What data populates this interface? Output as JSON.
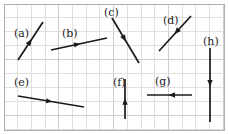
{
  "figure": {
    "width": 228,
    "height": 134,
    "background_color": "#ffffff",
    "grid": {
      "visible": true,
      "line_color": "#d8d8d8",
      "major_line_color": "#c9c9c9",
      "cell_width": 13.7,
      "cell_height": 13.9,
      "origin_x": 4,
      "origin_y": 4,
      "columns": 16,
      "rows": 9
    },
    "frame": {
      "visible": true,
      "color": "#b0b0b0",
      "x": 4,
      "y": 4,
      "width": 220,
      "height": 126
    },
    "vector_color": "#1a1a1a",
    "label_color": "#222222"
  },
  "vectors": [
    {
      "id": "a",
      "label": "(a)",
      "label_x": 14,
      "label_y": 34,
      "x1": 18,
      "y1": 60,
      "x2": 43,
      "y2": 22,
      "direction": "up-right",
      "head_t": 0.55,
      "head_size": 5.0
    },
    {
      "id": "b",
      "label": "(b)",
      "label_x": 62,
      "label_y": 34,
      "x1": 51,
      "y1": 50,
      "x2": 107,
      "y2": 38,
      "direction": "right-slightly-up",
      "head_t": 0.52,
      "head_size": 4.6
    },
    {
      "id": "c",
      "label": "(c)",
      "label_x": 104,
      "label_y": 13,
      "x1": 112,
      "y1": 18,
      "x2": 139,
      "y2": 63,
      "direction": "down-right",
      "head_t": 0.52,
      "head_size": 5.0
    },
    {
      "id": "d",
      "label": "(d)",
      "label_x": 163,
      "label_y": 21,
      "x1": 191,
      "y1": 16,
      "x2": 159,
      "y2": 51,
      "direction": "down-left",
      "head_t": 0.52,
      "head_size": 5.0
    },
    {
      "id": "e",
      "label": "(e)",
      "label_x": 14,
      "label_y": 83,
      "x1": 18,
      "y1": 96,
      "x2": 84,
      "y2": 107,
      "direction": "right-slightly-down",
      "head_t": 0.52,
      "head_size": 4.6
    },
    {
      "id": "f",
      "label": "(f)",
      "label_x": 113,
      "label_y": 83,
      "x1": 125,
      "y1": 119,
      "x2": 125,
      "y2": 79,
      "direction": "up",
      "head_t": 0.52,
      "head_size": 4.8
    },
    {
      "id": "g",
      "label": "(g)",
      "label_x": 155,
      "label_y": 82,
      "x1": 192,
      "y1": 95,
      "x2": 147,
      "y2": 95,
      "direction": "left",
      "head_t": 0.52,
      "head_size": 4.8
    },
    {
      "id": "h",
      "label": "(h)",
      "label_x": 203,
      "label_y": 42,
      "x1": 210,
      "y1": 48,
      "x2": 210,
      "y2": 122,
      "direction": "down",
      "head_t": 0.52,
      "head_size": 4.8
    }
  ]
}
